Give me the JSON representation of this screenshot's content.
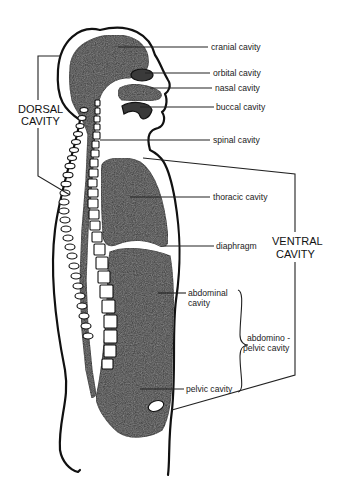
{
  "diagram": {
    "labels": {
      "cranial": "cranial cavity",
      "orbital": "orbital cavity",
      "nasal": "nasal cavity",
      "buccal": "buccal cavity",
      "spinal": "spinal cavity",
      "thoracic": "thoracic cavity",
      "diaphragm": "diaphragm",
      "abdominal_1": "abdominal",
      "abdominal_2": "cavity",
      "abdominopelvic_1": "abdomino -",
      "abdominopelvic_2": "pelvic cavity",
      "pelvic": "pelvic cavity"
    },
    "groups": {
      "dorsal_1": "DORSAL",
      "dorsal_2": "CAVITY",
      "ventral_1": "VENTRAL",
      "ventral_2": "CAVITY"
    },
    "colors": {
      "cavity_fill": "#3a3a3a",
      "outline": "#111111",
      "background": "#ffffff"
    }
  }
}
